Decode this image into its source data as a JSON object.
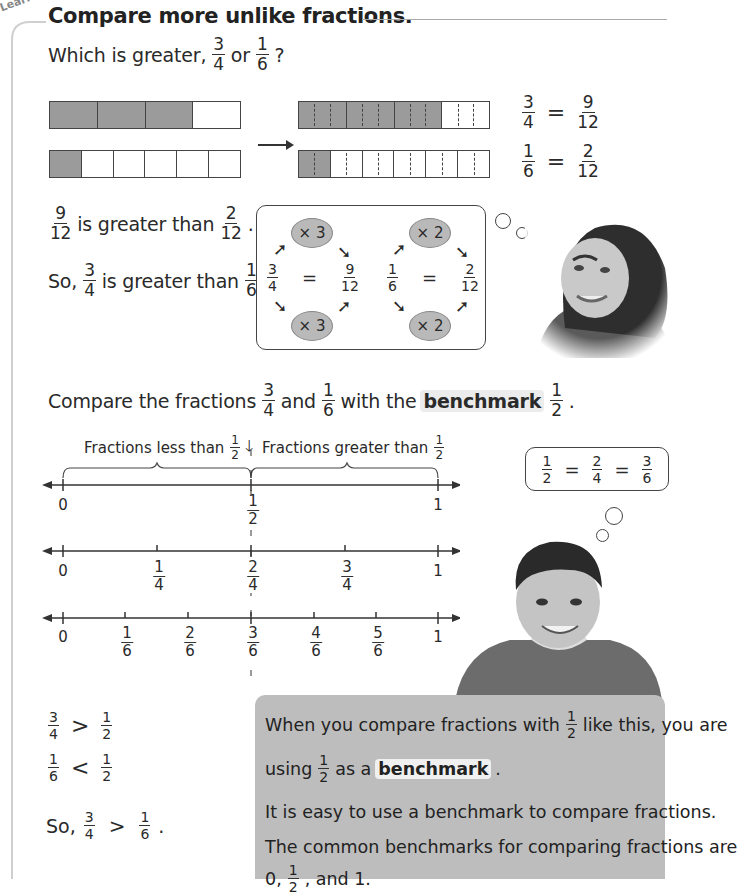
{
  "tab_label": "Learn",
  "title": "Compare more unlike fractions.",
  "question": {
    "prefix": "Which is greater,",
    "a": {
      "n": "3",
      "d": "4"
    },
    "joiner": "or",
    "b": {
      "n": "1",
      "d": "6"
    },
    "suffix": "?"
  },
  "bar_models": {
    "left": [
      {
        "parts": 4,
        "filled": 1,
        "shaded": 3
      },
      {
        "parts": 6,
        "shaded": 1
      }
    ],
    "right": [
      {
        "parts": 4,
        "subdiv": 3,
        "shaded": 3
      },
      {
        "parts": 6,
        "subdiv": 2,
        "shaded": 1
      }
    ],
    "equations": [
      {
        "lhs": {
          "n": "3",
          "d": "4"
        },
        "eq": "=",
        "rhs": {
          "n": "9",
          "d": "12"
        }
      },
      {
        "lhs": {
          "n": "1",
          "d": "6"
        },
        "eq": "=",
        "rhs": {
          "n": "2",
          "d": "12"
        }
      }
    ],
    "colors": {
      "shaded": "#9b9b9b",
      "border": "#444444"
    }
  },
  "comparison": {
    "line1": {
      "a": {
        "n": "9",
        "d": "12"
      },
      "text": "is greater than",
      "b": {
        "n": "2",
        "d": "12"
      },
      "end": "."
    },
    "line2": {
      "prefix": "So,",
      "a": {
        "n": "3",
        "d": "4"
      },
      "text": "is greater than",
      "b": {
        "n": "1",
        "d": "6"
      },
      "end": "."
    }
  },
  "equiv_box": {
    "left": {
      "top_op": "× 3",
      "bottom_op": "× 3",
      "lhs": {
        "n": "3",
        "d": "4"
      },
      "eq": "=",
      "rhs": {
        "n": "9",
        "d": "12"
      }
    },
    "right": {
      "top_op": "× 2",
      "bottom_op": "× 2",
      "lhs": {
        "n": "1",
        "d": "6"
      },
      "eq": "=",
      "rhs": {
        "n": "2",
        "d": "12"
      }
    }
  },
  "benchmark_intro": {
    "prefix": "Compare the fractions",
    "a": {
      "n": "3",
      "d": "4"
    },
    "joiner": "and",
    "b": {
      "n": "1",
      "d": "6"
    },
    "mid": "with the",
    "keyword": "benchmark",
    "half": {
      "n": "1",
      "d": "2"
    },
    "end": "."
  },
  "number_lines": {
    "brace_left": {
      "text": "Fractions less than",
      "frac": {
        "n": "1",
        "d": "2"
      }
    },
    "brace_right": {
      "text": "Fractions greater than",
      "frac": {
        "n": "1",
        "d": "2"
      }
    },
    "lines": [
      {
        "labels": [
          "0",
          "1/2",
          "1"
        ]
      },
      {
        "labels": [
          "0",
          "1/4",
          "2/4",
          "3/4",
          "1"
        ]
      },
      {
        "labels": [
          "0",
          "1/6",
          "2/6",
          "3/6",
          "4/6",
          "5/6",
          "1"
        ]
      }
    ],
    "line1_labels": {
      "zero": "0",
      "half": {
        "n": "1",
        "d": "2"
      },
      "one": "1"
    },
    "line2_labels": {
      "zero": "0",
      "q1": {
        "n": "1",
        "d": "4"
      },
      "q2": {
        "n": "2",
        "d": "4"
      },
      "q3": {
        "n": "3",
        "d": "4"
      },
      "one": "1"
    },
    "line3_labels": {
      "zero": "0",
      "s1": {
        "n": "1",
        "d": "6"
      },
      "s2": {
        "n": "2",
        "d": "6"
      },
      "s3": {
        "n": "3",
        "d": "6"
      },
      "s4": {
        "n": "4",
        "d": "6"
      },
      "s5": {
        "n": "5",
        "d": "6"
      },
      "one": "1"
    }
  },
  "thought_box": {
    "a": {
      "n": "1",
      "d": "2"
    },
    "eq1": "=",
    "b": {
      "n": "2",
      "d": "4"
    },
    "eq2": "=",
    "c": {
      "n": "3",
      "d": "6"
    }
  },
  "inequalities": {
    "row1": {
      "a": {
        "n": "3",
        "d": "4"
      },
      "op": ">",
      "b": {
        "n": "1",
        "d": "2"
      }
    },
    "row2": {
      "a": {
        "n": "1",
        "d": "6"
      },
      "op": "<",
      "b": {
        "n": "1",
        "d": "2"
      }
    },
    "row3": {
      "prefix": "So,",
      "a": {
        "n": "3",
        "d": "4"
      },
      "op": ">",
      "b": {
        "n": "1",
        "d": "6"
      },
      "end": "."
    }
  },
  "note": {
    "p1_prefix": "When you compare fractions with",
    "p1_half": {
      "n": "1",
      "d": "2"
    },
    "p1_suffix": "like this, you are",
    "p2_prefix": "using",
    "p2_half": {
      "n": "1",
      "d": "2"
    },
    "p2_mid": "as a",
    "p2_keyword": "benchmark",
    "p2_end": ".",
    "p3": "It is easy to use a benchmark to compare fractions.",
    "p4": "The common benchmarks for comparing fractions are",
    "p5_prefix": "0,",
    "p5_half": {
      "n": "1",
      "d": "2"
    },
    "p5_suffix": ", and 1.",
    "bg_color": "#bdbdbd"
  },
  "images": {
    "girl": "girl-thinking-photo",
    "boy": "boy-smiling-photo"
  }
}
